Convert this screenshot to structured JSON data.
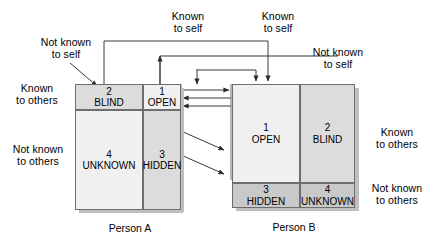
{
  "diagram": {
    "captions": {
      "person_a": "Person A",
      "person_b": "Person B"
    },
    "axis_labels": {
      "known_to_self_a": "Known\nto self",
      "known_to_self_b": "Known\nto self",
      "not_known_to_self_a": "Not known\nto self",
      "not_known_to_self_b": "Not known\nto self",
      "known_to_others_left": "Known\nto others",
      "not_known_to_others_left": "Not known\nto others",
      "known_to_others_right": "Known\nto others",
      "not_known_to_others_right": "Not known\nto others"
    },
    "person_a": {
      "name": "Person A",
      "quadrants": [
        {
          "num": "2",
          "name": "BLIND",
          "tone": "mid"
        },
        {
          "num": "1",
          "name": "OPEN",
          "tone": "light"
        },
        {
          "num": "4",
          "name": "UNKNOWN",
          "tone": "light"
        },
        {
          "num": "3",
          "name": "HIDDEN",
          "tone": "mid"
        }
      ]
    },
    "person_b": {
      "name": "Person B",
      "quadrants": [
        {
          "num": "1",
          "name": "OPEN",
          "tone": "light"
        },
        {
          "num": "2",
          "name": "BLIND",
          "tone": "mid"
        },
        {
          "num": "3",
          "name": "HIDDEN",
          "tone": "mid"
        },
        {
          "num": "4",
          "name": "UNKNOWN",
          "tone": "mid"
        }
      ]
    },
    "colors": {
      "line": "#3a3a3a",
      "border": "#6e6e6e",
      "light": "#f0f0f0",
      "mid": "#dcdcdc",
      "dark": "#c9c9c9",
      "shadow": "#bfbfbf",
      "background": "#ffffff"
    },
    "connectors": {
      "horizontal_arrows": 3,
      "diagonal_arrows": 2,
      "bracket_count": 3
    }
  }
}
